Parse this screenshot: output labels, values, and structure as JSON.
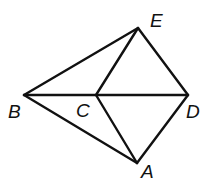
{
  "diagram": {
    "type": "geometry-figure",
    "stroke_color": "#111111",
    "background": "#ffffff",
    "points": {
      "A": {
        "x": 137,
        "y": 163,
        "label": "A",
        "label_x": 141,
        "label_y": 178
      },
      "B": {
        "x": 24,
        "y": 95,
        "label": "B",
        "label_x": 8,
        "label_y": 118
      },
      "C": {
        "x": 96,
        "y": 95,
        "label": "C",
        "label_x": 76,
        "label_y": 117
      },
      "D": {
        "x": 188,
        "y": 95,
        "label": "D",
        "label_x": 186,
        "label_y": 118
      },
      "E": {
        "x": 138,
        "y": 28,
        "label": "E",
        "label_x": 150,
        "label_y": 27
      }
    },
    "segments": [
      [
        "B",
        "E"
      ],
      [
        "B",
        "D"
      ],
      [
        "B",
        "A"
      ],
      [
        "C",
        "E"
      ],
      [
        "C",
        "A"
      ],
      [
        "E",
        "D"
      ],
      [
        "D",
        "A"
      ]
    ]
  }
}
